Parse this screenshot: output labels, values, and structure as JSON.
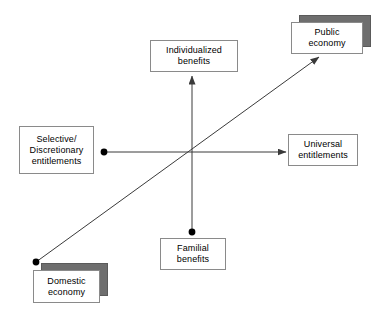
{
  "diagram": {
    "background_color": "#ffffff",
    "line_color": "#3a3a3a",
    "box_border_color": "#8a8a8a",
    "shadow_color": "#6e6e6e",
    "text_color": "#000000"
  },
  "nodes": [
    {
      "id": "individualized-benefits",
      "lines": [
        "Individualized",
        "benefits"
      ],
      "x": 150,
      "y": 40,
      "width": 88,
      "height": 32,
      "shadow": false
    },
    {
      "id": "public-economy",
      "lines": [
        "Public",
        "economy"
      ],
      "x": 291,
      "y": 22,
      "width": 72,
      "height": 32,
      "shadow": true,
      "shadow_dx": 8,
      "shadow_dy": -7
    },
    {
      "id": "selective-discretionary-entitlements",
      "lines": [
        "Selective/",
        "Discretionary",
        "entitlements"
      ],
      "x": 19,
      "y": 126,
      "width": 75,
      "height": 48,
      "shadow": false
    },
    {
      "id": "universal-entitlements",
      "lines": [
        "Universal",
        "entitlements"
      ],
      "x": 288,
      "y": 134,
      "width": 70,
      "height": 32,
      "shadow": false
    },
    {
      "id": "familial-benefits",
      "lines": [
        "Familial",
        "benefits"
      ],
      "x": 160,
      "y": 238,
      "width": 66,
      "height": 32,
      "shadow": false
    },
    {
      "id": "domestic-economy",
      "lines": [
        "Domestic",
        "economy"
      ],
      "x": 33,
      "y": 270,
      "width": 67,
      "height": 33,
      "shadow": true,
      "shadow_dx": 8,
      "shadow_dy": -7
    }
  ],
  "axes": [
    {
      "id": "horizontal-axis",
      "from_label": "Selective/Discretionary entitlements",
      "to_label": "Universal entitlements",
      "x1": 104,
      "y1": 152,
      "x2": 286,
      "y2": 152,
      "start_marker": "dot",
      "end_marker": "arrow"
    },
    {
      "id": "vertical-axis",
      "from_label": "Familial benefits",
      "to_label": "Individualized benefits",
      "x1": 192,
      "y1": 232,
      "x2": 192,
      "y2": 76,
      "start_marker": "dot",
      "end_marker": "arrow"
    },
    {
      "id": "diagonal-axis",
      "from_label": "Domestic economy",
      "to_label": "Public economy",
      "x1": 36,
      "y1": 262,
      "x2": 319,
      "y2": 57,
      "start_marker": "dot",
      "end_marker": "arrow"
    }
  ]
}
